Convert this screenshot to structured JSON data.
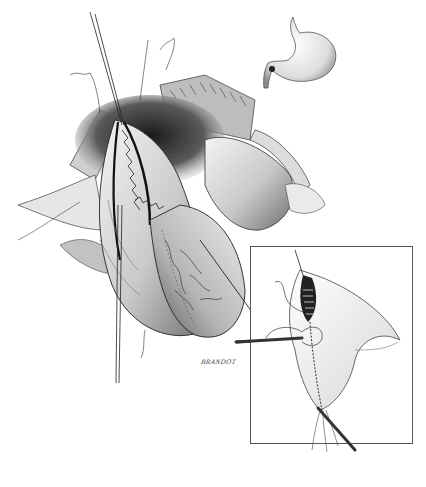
{
  "figure": {
    "type": "surgical-illustration",
    "style": "graphite pencil drawing, grayscale",
    "signature": "BRANDOT",
    "panels": {
      "main": "open abdominal view with organ incision closed by running suture, retraction sutures held upward",
      "orientation_inset": "stomach outline with marked pylorus region (top right)",
      "detail_inset": "boxed close-up of incision closure with needle holder and suture (bottom right)"
    }
  },
  "colors": {
    "background": "#ffffff",
    "ink_dark": "#1e1e1e",
    "ink_mid": "#6b6b6b",
    "shade_light": "#d6d6d6",
    "frame": "#555555"
  }
}
